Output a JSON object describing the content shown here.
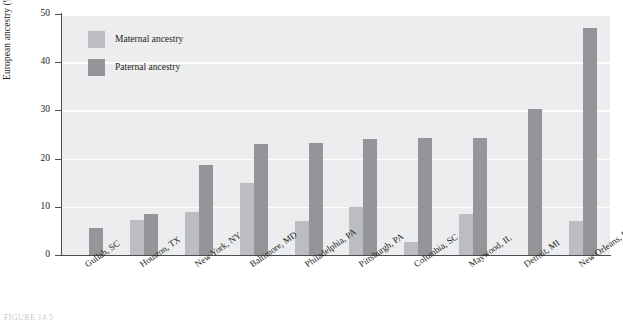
{
  "figure": {
    "caption_fragment": "FIGURE 14.5"
  },
  "legend": {
    "position": "top-left-inside",
    "items": [
      {
        "label": "Maternal ancestry",
        "color": "#bcbdc0",
        "key": "maternal"
      },
      {
        "label": "Paternal ancestry",
        "color": "#939598",
        "key": "paternal"
      }
    ]
  },
  "axes": {
    "y": {
      "title": "European ancestry (%)",
      "ticks": [
        "0",
        "10",
        "20",
        "30",
        "40",
        "50"
      ],
      "min": 0,
      "max": 50
    }
  },
  "chart_data": {
    "type": "bar",
    "title": "",
    "xlabel": "",
    "ylabel": "European ancestry (%)",
    "ylim": [
      0,
      50
    ],
    "ytick_step": 10,
    "grid": "horizontal-white",
    "legend_position": "top-left-inside",
    "plot_background": "#ecedee",
    "categories": [
      "Gullah, SC",
      "Houston, TX",
      "New York, NY",
      "Baltimore, MD",
      "Philadelphia, PA",
      "Pittsburgh, PA",
      "Columbia, SC",
      "Maywood, IL",
      "Detroit, MI",
      "New Orleans, LA"
    ],
    "series": [
      {
        "name": "Maternal ancestry",
        "color": "#bcbdc0",
        "values": [
          0,
          7.2,
          9.0,
          15.0,
          7.0,
          10.0,
          2.8,
          8.5,
          0,
          7.0
        ]
      },
      {
        "name": "Paternal ancestry",
        "color": "#939598",
        "values": [
          5.6,
          8.6,
          18.7,
          23.0,
          23.3,
          24.0,
          24.2,
          24.2,
          30.3,
          47.0
        ]
      }
    ]
  }
}
